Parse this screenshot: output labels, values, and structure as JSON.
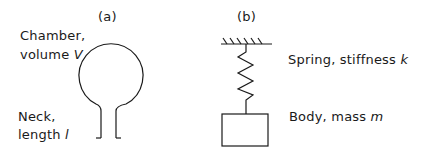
{
  "panel_a": {
    "label": "(a)",
    "chamber_line1": "Chamber,",
    "chamber_line2": "volume",
    "chamber_symbol": "V",
    "neck_line1": "Neck,",
    "neck_line2": "length",
    "neck_symbol": "l"
  },
  "panel_b": {
    "label": "(b)",
    "spring_text": "Spring, stiffness",
    "spring_symbol": "k",
    "body_text": "Body, mass",
    "body_symbol": "m"
  },
  "colors": {
    "stroke": "#1a1a1a",
    "background": "#ffffff"
  }
}
